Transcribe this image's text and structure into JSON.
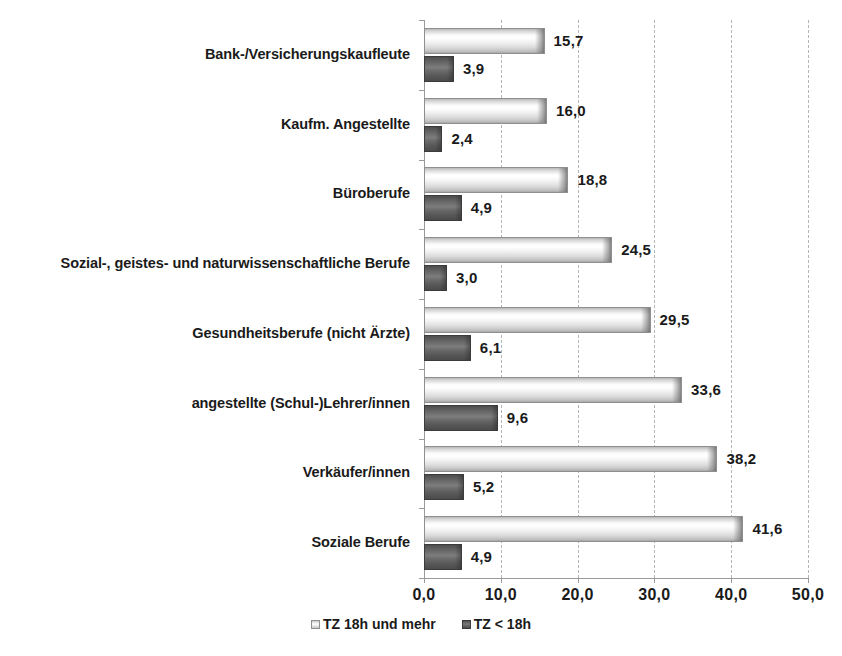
{
  "chart_data": {
    "type": "bar",
    "orientation": "horizontal",
    "title": "",
    "xlabel": "",
    "ylabel": "",
    "xlim": [
      0,
      50
    ],
    "xticks": [
      "0,0",
      "10,0",
      "20,0",
      "30,0",
      "40,0",
      "50,0"
    ],
    "xtick_values": [
      0,
      10,
      20,
      30,
      40,
      50
    ],
    "grid": "vertical-dashed",
    "legend_position": "bottom-center",
    "categories": [
      "Bank-/Versicherungskaufleute",
      "Kaufm. Angestellte",
      "Büroberufe",
      "Sozial-, geistes- und naturwissenschaftliche Berufe",
      "Gesundheitsberufe (nicht Ärzte)",
      "angestellte (Schul-)Lehrer/innen",
      "Verkäufer/innen",
      "Soziale Berufe"
    ],
    "series": [
      {
        "name": "TZ 18h und mehr",
        "color": "#e8e8e8",
        "values": [
          15.7,
          16.0,
          18.8,
          24.5,
          29.5,
          33.6,
          38.2,
          41.6
        ],
        "labels": [
          "15,7",
          "16,0",
          "18,8",
          "24,5",
          "29,5",
          "33,6",
          "38,2",
          "41,6"
        ]
      },
      {
        "name": "TZ < 18h",
        "color": "#5e5e5e",
        "values": [
          3.9,
          2.4,
          4.9,
          3.0,
          6.1,
          9.6,
          5.2,
          4.9
        ],
        "labels": [
          "3,9",
          "2,4",
          "4,9",
          "3,0",
          "6,1",
          "9,6",
          "5,2",
          "4,9"
        ]
      }
    ]
  },
  "legend": {
    "items": [
      {
        "label": "TZ 18h und mehr",
        "swatch": "light"
      },
      {
        "label": "TZ < 18h",
        "swatch": "dark"
      }
    ]
  }
}
